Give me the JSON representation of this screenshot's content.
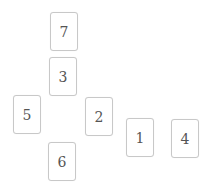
{
  "board": {
    "cards": [
      {
        "label": "7",
        "x": 50,
        "y": 12
      },
      {
        "label": "3",
        "x": 49,
        "y": 57
      },
      {
        "label": "5",
        "x": 13,
        "y": 95
      },
      {
        "label": "2",
        "x": 85,
        "y": 97
      },
      {
        "label": "1",
        "x": 126,
        "y": 118
      },
      {
        "label": "4",
        "x": 171,
        "y": 119
      },
      {
        "label": "6",
        "x": 48,
        "y": 142
      }
    ]
  }
}
